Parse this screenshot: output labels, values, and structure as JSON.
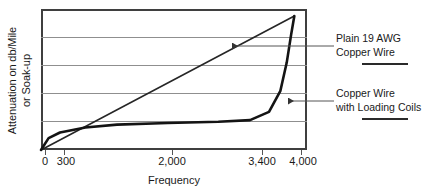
{
  "chart_data": {
    "type": "line",
    "title": "",
    "xlabel": "Frequency",
    "ylabel_line1": "Attenuation on db/Mile",
    "ylabel_line2": "or Soak-up",
    "xlim": [
      0,
      4200
    ],
    "ylim": [
      0,
      5
    ],
    "grid": true,
    "gridlines_y": [
      1,
      2,
      3,
      4
    ],
    "xticks": [
      {
        "value": 0,
        "label": "0"
      },
      {
        "value": 300,
        "label": "300"
      },
      {
        "value": 2000,
        "label": "2,000"
      },
      {
        "value": 3400,
        "label": "3,400"
      },
      {
        "value": 4000,
        "label": "4,000"
      }
    ],
    "yticks": [],
    "legend_position": "right-callouts",
    "series": [
      {
        "name": "Plain 19 AWG Copper Wire",
        "shape": "straight-rising-line",
        "points": [
          {
            "x": 0,
            "y": 0
          },
          {
            "x": 4000,
            "y": 4.75
          }
        ]
      },
      {
        "name": "Copper Wire with Loading Coils",
        "shape": "flat-then-sharp-knee",
        "points": [
          {
            "x": 0,
            "y": 0
          },
          {
            "x": 120,
            "y": 0.42
          },
          {
            "x": 300,
            "y": 0.62
          },
          {
            "x": 700,
            "y": 0.8
          },
          {
            "x": 1200,
            "y": 0.9
          },
          {
            "x": 2000,
            "y": 0.96
          },
          {
            "x": 2800,
            "y": 1.0
          },
          {
            "x": 3300,
            "y": 1.06
          },
          {
            "x": 3600,
            "y": 1.35
          },
          {
            "x": 3780,
            "y": 2.1
          },
          {
            "x": 3880,
            "y": 3.1
          },
          {
            "x": 3950,
            "y": 4.1
          },
          {
            "x": 4000,
            "y": 4.75
          }
        ]
      }
    ],
    "annotations": [
      {
        "id": "plain-wire",
        "line1": "Plain 19 AWG",
        "line2": "Copper Wire",
        "arrow_points_to": "straight-rising-line"
      },
      {
        "id": "loading-coils",
        "line1": "Copper Wire",
        "line2": "with Loading Coils",
        "arrow_points_to": "flat-then-sharp-knee"
      }
    ]
  }
}
